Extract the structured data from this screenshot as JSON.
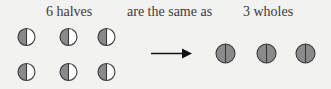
{
  "labels": {
    "left": "6 halves",
    "middle": "are the same as",
    "right": "3 wholes"
  },
  "colors": {
    "background": "#f2f2f0",
    "fill_gray": "#8a8a8a",
    "fill_white": "#ffffff",
    "stroke": "#3a3a3a",
    "text": "#3a3a3a"
  },
  "halves": {
    "count": 6,
    "rows": 2,
    "cols": 3,
    "shaded_side": "left"
  },
  "wholes": {
    "count": 3
  },
  "arrow": {
    "direction": "right"
  }
}
